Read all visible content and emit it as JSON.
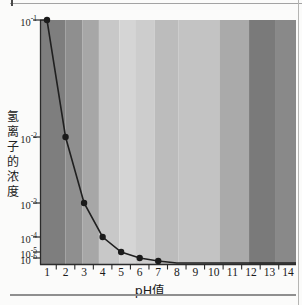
{
  "chart_data": {
    "type": "line",
    "title": "",
    "xlabel": "pH值",
    "ylabel": "氢离子的浓度",
    "x_range": [
      1,
      14
    ],
    "y_scale": "log",
    "grid": false,
    "legend": false,
    "x_tick_labels": [
      "1",
      "2",
      "3",
      "4",
      "5",
      "6",
      "7",
      "8",
      "9",
      "10",
      "11",
      "12",
      "13",
      "14"
    ],
    "y_ticks": [
      {
        "base": "10",
        "exponent": "-1"
      },
      {
        "base": "10",
        "exponent": "-2"
      },
      {
        "base": "10",
        "exponent": "-3"
      },
      {
        "base": "10",
        "exponent": "-4"
      },
      {
        "base": "10",
        "exponent": "-5"
      },
      {
        "base": "10",
        "exponent": "-6"
      }
    ],
    "points": [
      {
        "ph": 1,
        "value": 0.1
      },
      {
        "ph": 2,
        "value": 0.01
      },
      {
        "ph": 3,
        "value": 0.001
      },
      {
        "ph": 4,
        "value": 0.0001
      },
      {
        "ph": 5,
        "value": 1e-05
      },
      {
        "ph": 6,
        "value": 1e-06
      },
      {
        "ph": 7,
        "value": 1e-07
      },
      {
        "ph": 8,
        "value": 1e-08
      },
      {
        "ph": 9,
        "value": 1e-09
      },
      {
        "ph": 10,
        "value": 1e-10
      },
      {
        "ph": 11,
        "value": 1e-11
      },
      {
        "ph": 12,
        "value": 1e-12
      },
      {
        "ph": 13,
        "value": 1e-13
      },
      {
        "ph": 14,
        "value": 1e-14
      }
    ],
    "markers_visible_for_ph": [
      1,
      2,
      3,
      4,
      5,
      6,
      7
    ],
    "line_color": "#202020",
    "marker_color": "#1b1b1b",
    "axis_color": "#2b2b2b",
    "bands": [
      {
        "ph_from": 0.6,
        "ph_to": 2.0,
        "color": "#7e7e7e"
      },
      {
        "ph_from": 2.0,
        "ph_to": 2.9,
        "color": "#8f8f8f"
      },
      {
        "ph_from": 2.9,
        "ph_to": 3.8,
        "color": "#a7a7a7"
      },
      {
        "ph_from": 3.8,
        "ph_to": 4.9,
        "color": "#c8c8c8"
      },
      {
        "ph_from": 4.9,
        "ph_to": 5.8,
        "color": "#d5d5d5"
      },
      {
        "ph_from": 5.8,
        "ph_to": 6.8,
        "color": "#cdcdcd"
      },
      {
        "ph_from": 6.8,
        "ph_to": 8.1,
        "color": "#bcbcbc"
      },
      {
        "ph_from": 8.1,
        "ph_to": 10.3,
        "color": "#c3c3c3"
      },
      {
        "ph_from": 10.3,
        "ph_to": 11.9,
        "color": "#aaaaaa"
      },
      {
        "ph_from": 11.9,
        "ph_to": 13.3,
        "color": "#7a7a7a"
      },
      {
        "ph_from": 13.3,
        "ph_to": 14.45,
        "color": "#898989"
      }
    ]
  }
}
